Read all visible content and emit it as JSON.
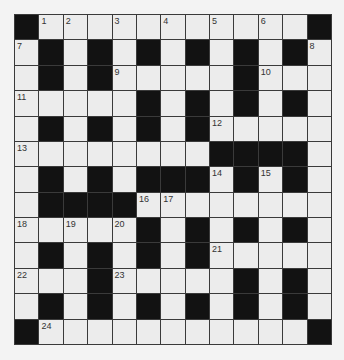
{
  "puzzle": {
    "rows": 13,
    "cols": 13,
    "colors": {
      "white_cell": "#ececec",
      "black_cell": "#121212",
      "grid_line": "#3a3a3a",
      "background": "#f3f3f3"
    },
    "layout": [
      "#WW.W.W.W.W.#",
      "W#W#W#W#W#W#W",
      "W#W#WWWWW#WWW",
      "WWWWW#W#W#W#W",
      "W#W#W#W#WWWWW",
      "WWWWWWWW####W",
      "W#W#W###W#W#W",
      "W####WWWWWWWW",
      "WWWWW#W#W#W#W",
      "W#W#W#W#WWWWW",
      "WWW#WWWWW#W#W",
      "W#W#W#W#W#W#W",
      "#WWWWWWWWWWW#"
    ],
    "numbers": [
      {
        "r": 0,
        "c": 1,
        "n": "1"
      },
      {
        "r": 0,
        "c": 2,
        "n": "2"
      },
      {
        "r": 0,
        "c": 4,
        "n": "3"
      },
      {
        "r": 0,
        "c": 6,
        "n": "4"
      },
      {
        "r": 0,
        "c": 8,
        "n": "5"
      },
      {
        "r": 0,
        "c": 10,
        "n": "6"
      },
      {
        "r": 1,
        "c": 0,
        "n": "7"
      },
      {
        "r": 1,
        "c": 12,
        "n": "8"
      },
      {
        "r": 2,
        "c": 4,
        "n": "9"
      },
      {
        "r": 2,
        "c": 10,
        "n": "10"
      },
      {
        "r": 3,
        "c": 0,
        "n": "11"
      },
      {
        "r": 4,
        "c": 8,
        "n": "12"
      },
      {
        "r": 5,
        "c": 0,
        "n": "13"
      },
      {
        "r": 6,
        "c": 8,
        "n": "14"
      },
      {
        "r": 6,
        "c": 10,
        "n": "15"
      },
      {
        "r": 7,
        "c": 5,
        "n": "16"
      },
      {
        "r": 7,
        "c": 6,
        "n": "17"
      },
      {
        "r": 8,
        "c": 0,
        "n": "18"
      },
      {
        "r": 8,
        "c": 2,
        "n": "19"
      },
      {
        "r": 8,
        "c": 4,
        "n": "20"
      },
      {
        "r": 9,
        "c": 8,
        "n": "21"
      },
      {
        "r": 10,
        "c": 0,
        "n": "22"
      },
      {
        "r": 10,
        "c": 4,
        "n": "23"
      },
      {
        "r": 12,
        "c": 1,
        "n": "24"
      }
    ]
  }
}
